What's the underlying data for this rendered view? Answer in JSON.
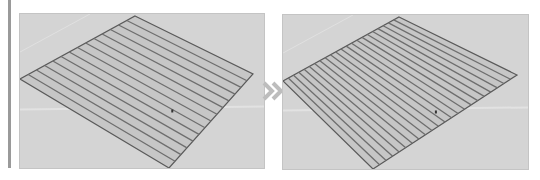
{
  "figure": {
    "arrow_icon": "double-chevron-right",
    "colors": {
      "viewport_bg": "#d4d4d4",
      "plane_fill": "#c6c6c6",
      "stripe_line": "#6e6e6e",
      "edge_line": "#5a5a5a",
      "arrow": "#bdbdbd",
      "sidebar_bar": "#9a9a9a"
    }
  },
  "panels": [
    {
      "id": "before",
      "stripe_count": 14,
      "plane": {
        "top": [
          115,
          2
        ],
        "right": [
          233,
          60
        ],
        "bottom": [
          149,
          154
        ],
        "left": [
          0,
          65
        ]
      }
    },
    {
      "id": "after",
      "stripe_count": 22,
      "plane": {
        "top": [
          116,
          2
        ],
        "right": [
          234,
          60
        ],
        "bottom": [
          90,
          154
        ],
        "left": [
          0,
          66
        ]
      }
    }
  ]
}
